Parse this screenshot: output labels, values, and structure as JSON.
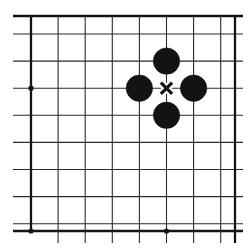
{
  "figure": {
    "kind": "go-board-diagram",
    "background_color": "#ffffff",
    "line_color": "#2b2b2b",
    "edge_line_color": "#141414",
    "stone_color": "#131313",
    "mark_color": "#111111"
  },
  "board": {
    "origin_x": 31,
    "origin_y": 34,
    "spacing": 27.1,
    "columns": 8,
    "rows": 8,
    "x_coords": [
      31,
      58.1,
      85.2,
      112.3,
      139.4,
      166.5,
      193.6,
      220.7,
      235
    ],
    "y_coords": [
      16,
      34,
      61.1,
      88.2,
      115.3,
      142.4,
      169.5,
      196.6,
      223.7,
      231
    ],
    "vertical_lines": [
      {
        "name": "v-0",
        "x": 31,
        "weight": "edge",
        "top": 16,
        "bottom": 231
      },
      {
        "name": "v-1",
        "x": 58.1,
        "weight": "normal",
        "top": 16,
        "bottom": 243
      },
      {
        "name": "v-2",
        "x": 85.2,
        "weight": "normal",
        "top": 16,
        "bottom": 243
      },
      {
        "name": "v-3",
        "x": 112.3,
        "weight": "normal",
        "top": 16,
        "bottom": 243
      },
      {
        "name": "v-4",
        "x": 139.4,
        "weight": "normal",
        "top": 16,
        "bottom": 243
      },
      {
        "name": "v-5",
        "x": 166.5,
        "weight": "normal",
        "top": 16,
        "bottom": 243
      },
      {
        "name": "v-6",
        "x": 193.6,
        "weight": "normal",
        "top": 16,
        "bottom": 243
      },
      {
        "name": "v-7",
        "x": 220.7,
        "weight": "normal",
        "top": 16,
        "bottom": 243
      },
      {
        "name": "v-8",
        "x": 235,
        "weight": "edge",
        "top": 16,
        "bottom": 243
      }
    ],
    "horizontal_lines": [
      {
        "name": "h-0",
        "y": 16,
        "weight": "edge",
        "left": 13,
        "right": 243
      },
      {
        "name": "h-1",
        "y": 34,
        "weight": "normal",
        "left": 13,
        "right": 243
      },
      {
        "name": "h-2",
        "y": 61.1,
        "weight": "normal",
        "left": 13,
        "right": 243
      },
      {
        "name": "h-3",
        "y": 88.2,
        "weight": "normal",
        "left": 13,
        "right": 243
      },
      {
        "name": "h-4",
        "y": 115.3,
        "weight": "normal",
        "left": 13,
        "right": 243
      },
      {
        "name": "h-5",
        "y": 142.4,
        "weight": "normal",
        "left": 13,
        "right": 243
      },
      {
        "name": "h-6",
        "y": 169.5,
        "weight": "normal",
        "left": 13,
        "right": 243
      },
      {
        "name": "h-7",
        "y": 196.6,
        "weight": "normal",
        "left": 13,
        "right": 243
      },
      {
        "name": "h-8",
        "y": 223.7,
        "weight": "normal",
        "left": 13,
        "right": 243
      },
      {
        "name": "h-9",
        "y": 231,
        "weight": "edge",
        "left": 13,
        "right": 243
      }
    ],
    "star_points": [
      {
        "name": "star-left",
        "x": 31,
        "y": 88.2,
        "radius": 2.6
      },
      {
        "name": "star-bottom-left",
        "x": 31,
        "y": 231,
        "radius": 2.6
      },
      {
        "name": "star-bottom-center",
        "x": 166.5,
        "y": 231,
        "radius": 2.6
      }
    ]
  },
  "stones": [
    {
      "name": "stone-north",
      "color": "black",
      "x": 166.5,
      "y": 61.1,
      "radius": 13.2
    },
    {
      "name": "stone-west",
      "color": "black",
      "x": 139.4,
      "y": 88.2,
      "radius": 13.2
    },
    {
      "name": "stone-east",
      "color": "black",
      "x": 193.6,
      "y": 88.2,
      "radius": 13.2
    },
    {
      "name": "stone-south",
      "color": "black",
      "x": 166.5,
      "y": 115.3,
      "radius": 13.2
    }
  ],
  "marks": [
    {
      "name": "cross-mark",
      "symbol": "x",
      "x": 166.5,
      "y": 88.2,
      "half_size": 5.6,
      "label": "marked empty point"
    }
  ]
}
